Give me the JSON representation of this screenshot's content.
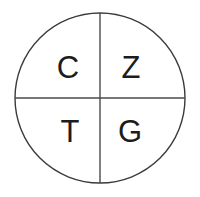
{
  "diagram": {
    "name": "quartered-circle",
    "shape": "circle",
    "divider_count": 2,
    "colors": {
      "background": "#ffffff",
      "circle_stroke": "#3a3a3a",
      "divider_stroke": "#4a4a4a",
      "label_text": "#1c1c1c"
    },
    "geometry": {
      "center_x": 100,
      "center_y": 98,
      "radius": 85,
      "stroke_width": 1.4
    },
    "quadrants": [
      {
        "position": "top-left",
        "label": "C",
        "x": 68,
        "y": 70
      },
      {
        "position": "top-right",
        "label": "Z",
        "x": 131,
        "y": 70
      },
      {
        "position": "bottom-left",
        "label": "T",
        "x": 70,
        "y": 134
      },
      {
        "position": "bottom-right",
        "label": "G",
        "x": 130,
        "y": 134
      }
    ]
  }
}
